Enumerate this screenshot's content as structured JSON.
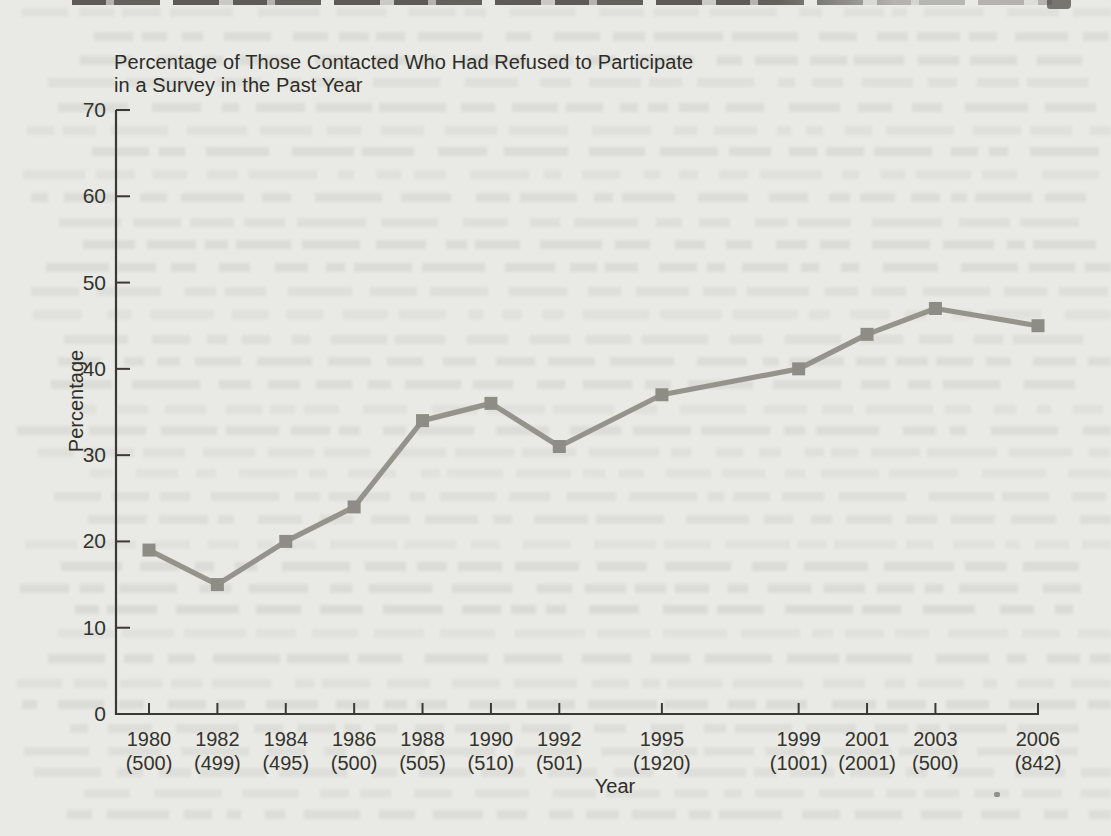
{
  "page": {
    "background_color": "#e9e9e5",
    "ink_color": "#34332d"
  },
  "chart_data": {
    "type": "line",
    "title_line1": "Percentage of Those Contacted Who Had Refused to Participate",
    "title_line2": "in a Survey in the Past Year",
    "xlabel": "Year",
    "ylabel": "Percentage",
    "ylim": [
      0,
      70
    ],
    "yticks": [
      0,
      10,
      20,
      30,
      40,
      50,
      60,
      70
    ],
    "grid": false,
    "legend": false,
    "marker": "square",
    "series_color": "#95948c",
    "marker_color": "#8e8d85",
    "axis_color": "#3a3934",
    "categories": [
      "1980",
      "1982",
      "1984",
      "1986",
      "1988",
      "1990",
      "1992",
      "1995",
      "1999",
      "2001",
      "2003",
      "2006"
    ],
    "sample_sizes": [
      "(500)",
      "(499)",
      "(495)",
      "(500)",
      "(505)",
      "(510)",
      "(501)",
      "(1920)",
      "(1001)",
      "(2001)",
      "(500)",
      "(842)"
    ],
    "years_numeric": [
      1980,
      1982,
      1984,
      1986,
      1988,
      1990,
      1992,
      1995,
      1999,
      2001,
      2003,
      2006
    ],
    "values": [
      19,
      15,
      20,
      24,
      34,
      36,
      31,
      37,
      40,
      44,
      47,
      45
    ]
  }
}
